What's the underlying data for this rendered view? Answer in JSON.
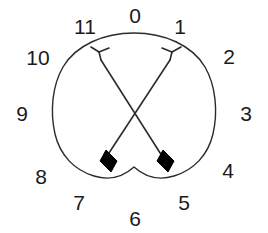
{
  "figure": {
    "name": "clock-position-diagram",
    "background_color": "#ffffff",
    "stroke_color": "#2b2b2b",
    "fill_color": "#000000",
    "text_color": "#1b1b1b",
    "width": 268,
    "height": 233
  },
  "outline": {
    "name": "heart-shape-outline",
    "description": "closed heart/apple shaped contour with rounded top and notched bottom center",
    "stroke_color": "#2b2b2b",
    "stroke_width": 1.4,
    "fill": "none"
  },
  "clock_labels": [
    {
      "label": "0",
      "position": "top-center",
      "x": 135,
      "y": 15
    },
    {
      "label": "1",
      "position": "top-right",
      "x": 180,
      "y": 26
    },
    {
      "label": "2",
      "position": "upper-right",
      "x": 229,
      "y": 56
    },
    {
      "label": "3",
      "position": "right",
      "x": 246,
      "y": 113
    },
    {
      "label": "4",
      "position": "lower-right",
      "x": 228,
      "y": 170
    },
    {
      "label": "5",
      "position": "bottom-right",
      "x": 184,
      "y": 202
    },
    {
      "label": "6",
      "position": "bottom-center",
      "x": 135,
      "y": 218
    },
    {
      "label": "7",
      "position": "bottom-left",
      "x": 79,
      "y": 202
    },
    {
      "label": "8",
      "position": "lower-left",
      "x": 41,
      "y": 176
    },
    {
      "label": "9",
      "position": "left",
      "x": 22,
      "y": 113
    },
    {
      "label": "10",
      "position": "upper-left",
      "x": 38,
      "y": 57
    },
    {
      "label": "11",
      "position": "top-left",
      "x": 85,
      "y": 26
    }
  ],
  "arrows": [
    {
      "name": "arrow-left-to-right",
      "description": "arrow with Y-shaped nock at upper left pointing down-right to solid arrowhead",
      "nock_x": 101,
      "nock_y": 58,
      "head_x": 166,
      "head_y": 160,
      "stroke_color": "#2b2b2b",
      "head_fill": "#000000"
    },
    {
      "name": "arrow-right-to-left",
      "description": "arrow with Y-shaped nock at upper right pointing down-left to solid arrowhead",
      "nock_x": 170,
      "nock_y": 58,
      "head_x": 100,
      "head_y": 160,
      "stroke_color": "#2b2b2b",
      "head_fill": "#000000"
    }
  ]
}
